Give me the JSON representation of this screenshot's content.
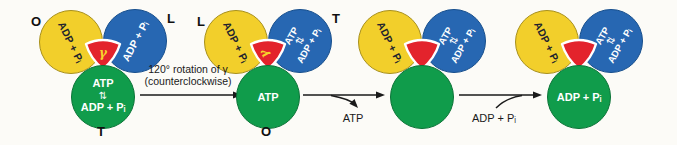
{
  "figure": {
    "colors": {
      "yellow": "#F2CF2B",
      "blue": "#2767B2",
      "green": "#109C4B",
      "red": "#E3232C",
      "background": "#FCFBF7"
    },
    "clusters": [
      {
        "label_top_left": "O",
        "label_top_right": "L",
        "label_bottom": "T",
        "yellow_text": "ADP + Pᵢ",
        "blue_text": "ADP + Pᵢ",
        "green_line1": "ATP",
        "green_eq": "⇅",
        "green_line2": "ADP + Pᵢ",
        "gamma": "γ"
      },
      {
        "label_top_left": "L",
        "label_top_right": "T",
        "label_bottom": "O",
        "yellow_text": "ADP + Pᵢ",
        "blue_line1": "ATP",
        "blue_eq": "⇅",
        "blue_line2": "ADP + Pᵢ",
        "green_text": "ATP",
        "gamma": "γ"
      },
      {
        "yellow_text": "ADP + Pᵢ",
        "blue_line1": "ATP",
        "blue_eq": "⇅",
        "blue_line2": "ADP + Pᵢ"
      },
      {
        "yellow_text": "ADP + Pᵢ",
        "blue_line1": "ATP",
        "blue_eq": "⇅",
        "blue_line2": "ADP + Pᵢ",
        "green_text": "ADP + Pᵢ"
      }
    ],
    "arrows": {
      "rotation_label_line1": "120° rotation of γ",
      "rotation_label_line2": "(counterclockwise)",
      "atp_release_label": "ATP",
      "adp_binding_label": "ADP + Pᵢ"
    }
  }
}
